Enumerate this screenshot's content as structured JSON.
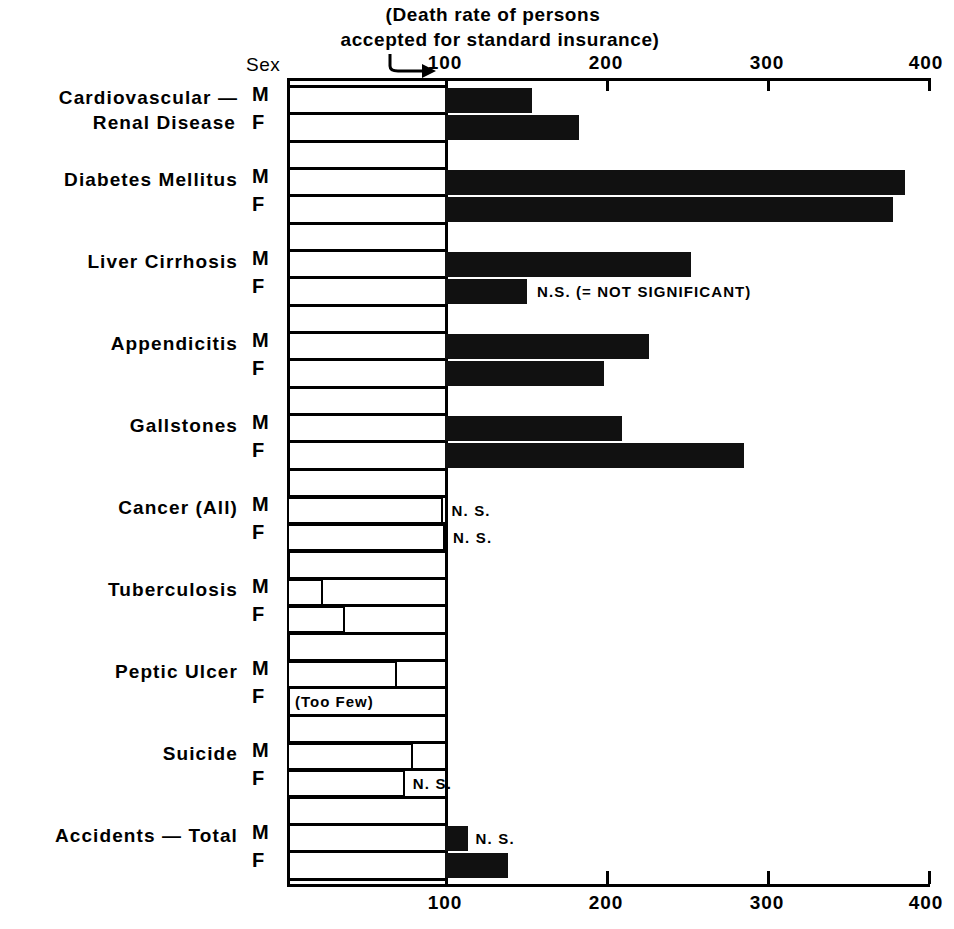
{
  "caption": {
    "line1": "(Death rate of persons",
    "line2": "accepted for standard insurance)"
  },
  "sex_header": "Sex",
  "legend_note": "N.S. (= NOT SIGNIFICANT)",
  "too_few_note": "(Too Few)",
  "ns_label": "N. S.",
  "axis": {
    "ticks": [
      "100",
      "200",
      "300",
      "400"
    ]
  },
  "chart_data": {
    "type": "bar",
    "orientation": "horizontal",
    "title": "(Death rate of persons accepted for standard insurance)",
    "xlabel": "",
    "ylabel": "",
    "xlim": [
      2,
      400
    ],
    "xticks": [
      100,
      200,
      300,
      400
    ],
    "baseline": 100,
    "grid": false,
    "legend": "N.S. (= NOT SIGNIFICANT)",
    "categories": [
      "Cardiovascular — Renal Disease",
      "Diabetes Mellitus",
      "Liver Cirrhosis",
      "Appendicitis",
      "Gallstones",
      "Cancer (All)",
      "Tuberculosis",
      "Peptic Ulcer",
      "Suicide",
      "Accidents — Total"
    ],
    "series": [
      {
        "name": "M",
        "values": [
          154,
          386,
          253,
          227,
          210,
          99,
          24,
          70,
          80,
          114
        ]
      },
      {
        "name": "F",
        "values": [
          183,
          378,
          151,
          199,
          286,
          100,
          38,
          null,
          75,
          139
        ]
      }
    ],
    "annotations": [
      {
        "category": "Liver Cirrhosis",
        "sex": "F",
        "text": "N.S. (= NOT SIGNIFICANT)"
      },
      {
        "category": "Cancer (All)",
        "sex": "M",
        "text": "N. S."
      },
      {
        "category": "Cancer (All)",
        "sex": "F",
        "text": "N. S."
      },
      {
        "category": "Peptic Ulcer",
        "sex": "F",
        "text": "(Too Few)"
      },
      {
        "category": "Suicide",
        "sex": "F",
        "text": "N. S."
      },
      {
        "category": "Accidents — Total",
        "sex": "M",
        "text": "N. S."
      }
    ]
  },
  "rows": [
    {
      "label_line1": "Cardiovascular —",
      "label_line2": "Renal Disease",
      "label_top": 88,
      "m": {
        "value": 154,
        "style": "filled",
        "note": ""
      },
      "f": {
        "value": 183,
        "style": "filled",
        "note": ""
      }
    },
    {
      "label_line1": "Diabetes Mellitus",
      "label_line2": "",
      "label_top": 190,
      "m": {
        "value": 386,
        "style": "filled",
        "note": ""
      },
      "f": {
        "value": 378,
        "style": "filled",
        "note": ""
      }
    },
    {
      "label_line1": "Liver Cirrhosis",
      "label_line2": "",
      "label_top": 272,
      "m": {
        "value": 253,
        "style": "filled",
        "note": ""
      },
      "f": {
        "value": 151,
        "style": "filled",
        "note": "N.S. (= NOT SIGNIFICANT)"
      }
    },
    {
      "label_line1": "Appendicitis",
      "label_line2": "",
      "label_top": 355,
      "m": {
        "value": 227,
        "style": "filled",
        "note": ""
      },
      "f": {
        "value": 199,
        "style": "filled",
        "note": ""
      }
    },
    {
      "label_line1": "Gallstones",
      "label_line2": "",
      "label_top": 437,
      "m": {
        "value": 210,
        "style": "filled",
        "note": ""
      },
      "f": {
        "value": 286,
        "style": "filled",
        "note": ""
      }
    },
    {
      "label_line1": "Cancer (All)",
      "label_line2": "",
      "label_top": 519,
      "m": {
        "value": 99,
        "style": "open",
        "note": "N. S."
      },
      "f": {
        "value": 100,
        "style": "open",
        "note": "N. S."
      }
    },
    {
      "label_line1": "Tuberculosis",
      "label_line2": "",
      "label_top": 601,
      "m": {
        "value": 24,
        "style": "open",
        "note": ""
      },
      "f": {
        "value": 38,
        "style": "open",
        "note": ""
      }
    },
    {
      "label_line1": "Peptic Ulcer",
      "label_line2": "",
      "label_top": 683,
      "m": {
        "value": 70,
        "style": "open",
        "note": ""
      },
      "f": {
        "value": null,
        "style": "none",
        "note": "(Too Few)"
      }
    },
    {
      "label_line1": "Suicide",
      "label_line2": "",
      "label_top": 765,
      "m": {
        "value": 80,
        "style": "open",
        "note": ""
      },
      "f": {
        "value": 75,
        "style": "open",
        "note": "N. S."
      }
    },
    {
      "label_line1": "Accidents — Total",
      "label_line2": "",
      "label_top": 847,
      "m": {
        "value": 114,
        "style": "filled",
        "note": "N. S."
      },
      "f": {
        "value": 139,
        "style": "filled",
        "note": ""
      }
    }
  ]
}
